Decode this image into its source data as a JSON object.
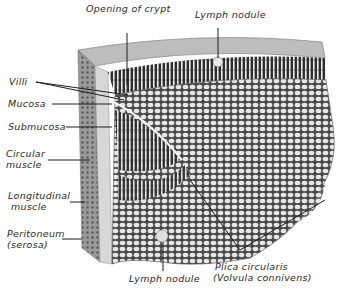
{
  "diagram": {
    "colors": {
      "ink": "#2a2a2a",
      "background": "#ffffff",
      "tissue_dark": "#3a3a3a",
      "tissue_light": "#d8d8d8"
    },
    "labels": {
      "opening_of_crypt": "Opening of crypt",
      "lymph_nodule_top": "Lymph nodule",
      "villi": "Villi",
      "mucosa": "Mucosa",
      "submucosa": "Submucosa",
      "circular_muscle_1": "Circular",
      "circular_muscle_2": "muscle",
      "longitudinal_muscle_1": "Longitudinal",
      "longitudinal_muscle_2": "muscle",
      "peritoneum_1": "Peritoneum",
      "peritoneum_2": "(serosa)",
      "lymph_nodule_bottom": "Lymph nodule",
      "plica_1": "Plica circularis",
      "plica_2": "(Volvula connivens)"
    }
  }
}
